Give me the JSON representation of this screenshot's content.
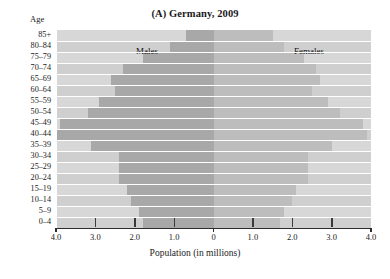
{
  "figure": {
    "title_prefix": "(A)",
    "title_text": "Germany, 2009",
    "age_caption": "Age",
    "xaxis_title": "Population (in millions)",
    "males_label": "Males",
    "females_label": "Females"
  },
  "colors": {
    "male_bar": "#a8a8a8",
    "female_bar": "#bdbdbd",
    "band_light": "#d7d7d7",
    "band_dark": "#cfcfcf",
    "gridline": "#ffffff",
    "axis": "#2b2b2b"
  },
  "chart_data": {
    "type": "bar",
    "subtype": "population-pyramid",
    "title": "(A) Germany, 2009",
    "xlabel": "Population (in millions)",
    "ylabel": "Age",
    "xlim": [
      -4.0,
      4.0
    ],
    "xticks": [
      -4.0,
      -3.0,
      -2.0,
      -1.0,
      0,
      1.0,
      2.0,
      3.0,
      4.0
    ],
    "xticklabels": [
      "4.0",
      "3.0",
      "2.0",
      "1.0",
      "0",
      "1.0",
      "2.0",
      "3.0",
      "4.0"
    ],
    "grid": true,
    "legend_position": "in-plot",
    "categories": [
      "85+",
      "80–84",
      "75–79",
      "70–74",
      "65–69",
      "60–64",
      "55–59",
      "50–54",
      "45–49",
      "40–44",
      "35–39",
      "30–34",
      "25–29",
      "20–24",
      "15–19",
      "10–14",
      "5–9",
      "0–4"
    ],
    "series": [
      {
        "name": "Males",
        "side": "left",
        "values": [
          0.7,
          1.1,
          1.8,
          2.3,
          2.6,
          2.5,
          2.9,
          3.2,
          3.9,
          4.0,
          3.1,
          2.4,
          2.4,
          2.4,
          2.2,
          2.1,
          1.9,
          1.8
        ]
      },
      {
        "name": "Females",
        "side": "right",
        "values": [
          1.5,
          1.8,
          2.3,
          2.6,
          2.7,
          2.5,
          2.9,
          3.2,
          3.8,
          3.9,
          3.0,
          2.4,
          2.4,
          2.4,
          2.1,
          2.0,
          1.8,
          1.7
        ]
      }
    ]
  }
}
